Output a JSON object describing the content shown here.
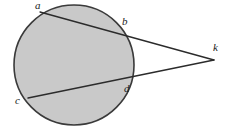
{
  "figure": {
    "width": 233,
    "height": 130,
    "background_color": "#ffffff",
    "circle": {
      "name": "shaded-circle",
      "center_x": 74,
      "center_y": 65,
      "radius": 60,
      "fill_color": "#c9c9c9",
      "stroke_color": "#3a3a3a",
      "stroke_width": 1.6
    },
    "line_color": "#2b2b2b",
    "line_width": 1.3,
    "points": [
      {
        "id": "a",
        "label": "a",
        "x": 40,
        "y": 12,
        "label_x": 35,
        "label_y": 0
      },
      {
        "id": "b",
        "label": "b",
        "x": 118,
        "y": 30,
        "label_x": 122,
        "label_y": 16
      },
      {
        "id": "c",
        "label": "c",
        "x": 28,
        "y": 98,
        "label_x": 15,
        "label_y": 95
      },
      {
        "id": "d",
        "label": "d",
        "x": 124,
        "y": 79,
        "label_x": 124,
        "label_y": 83
      },
      {
        "id": "k",
        "label": "k",
        "x": 214,
        "y": 60,
        "label_x": 213,
        "label_y": 42
      }
    ],
    "segments": [
      {
        "id": "secant-ak",
        "from": "a",
        "to": "k",
        "through": "b"
      },
      {
        "id": "secant-ck",
        "from": "c",
        "to": "k",
        "through": "d"
      }
    ]
  }
}
